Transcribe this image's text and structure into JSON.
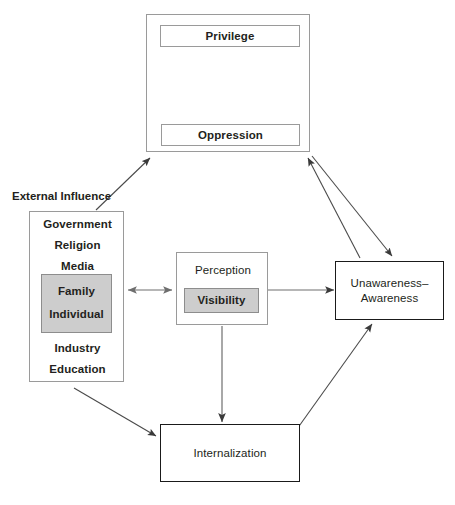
{
  "diagram": {
    "colors": {
      "gray_fill": "#cdcdcd",
      "gray_border": "#9a9a9a",
      "black_border": "#1a1a1a",
      "text": "#231f20",
      "background": "#ffffff"
    },
    "nodes": {
      "privilege_oppression_container": {
        "name": "privilege-oppression-container",
        "border": "gray"
      },
      "privilege": {
        "label": "Privilege",
        "border": "gray",
        "fill": "white"
      },
      "oppression": {
        "label": "Oppression",
        "border": "gray",
        "fill": "white"
      },
      "external_influence": {
        "label": "External Influence",
        "border": "gray",
        "fill": "white",
        "items_top": [
          "Government",
          "Religion",
          "Media"
        ],
        "items_core": [
          "Family",
          "Individual"
        ],
        "items_bottom": [
          "Industry",
          "Education"
        ]
      },
      "perception": {
        "label": "Perception",
        "border": "gray",
        "fill": "white",
        "inner": {
          "label": "Visibility",
          "fill": "#cdcdcd"
        }
      },
      "unawareness_awareness": {
        "label": "Unawareness–Awareness",
        "line1": "Unawareness–",
        "line2": "Awareness",
        "border": "black",
        "fill": "white"
      },
      "internalization": {
        "label": "Internalization",
        "border": "black",
        "fill": "white"
      }
    },
    "connectors": [
      {
        "name": "privilege-oppression-bidirectional",
        "from": "privilege",
        "to": "oppression",
        "arrowheads": "both",
        "orientation": "vertical"
      },
      {
        "name": "external-influence-to-privilege-oppression",
        "from": "external-influence",
        "to": "privilege-oppression-container",
        "arrowheads": "end",
        "orientation": "diagonal-up-right"
      },
      {
        "name": "unawareness-to-privilege-oppression",
        "from": "unawareness-awareness",
        "to": "privilege-oppression-container",
        "arrowheads": "end",
        "orientation": "diagonal-up-left"
      },
      {
        "name": "privilege-oppression-to-unawareness",
        "from": "privilege-oppression-container",
        "to": "unawareness-awareness",
        "arrowheads": "end",
        "orientation": "diagonal-down-right"
      },
      {
        "name": "external-influence-to-perception",
        "from": "external-influence",
        "to": "perception",
        "arrowheads": "both",
        "orientation": "horizontal"
      },
      {
        "name": "perception-to-unawareness",
        "from": "perception",
        "to": "unawareness-awareness",
        "arrowheads": "end",
        "orientation": "horizontal"
      },
      {
        "name": "perception-to-internalization",
        "from": "perception",
        "to": "internalization",
        "arrowheads": "end",
        "orientation": "vertical-down"
      },
      {
        "name": "external-influence-to-internalization",
        "from": "external-influence",
        "to": "internalization",
        "arrowheads": "end",
        "orientation": "diagonal-down-right"
      },
      {
        "name": "internalization-to-unawareness",
        "from": "internalization",
        "to": "unawareness-awareness",
        "arrowheads": "end",
        "orientation": "diagonal-up-right"
      }
    ]
  }
}
